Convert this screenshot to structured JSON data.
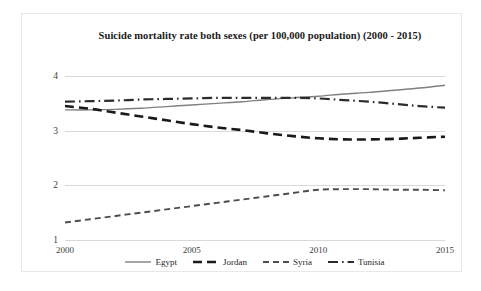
{
  "chart_data": {
    "type": "line",
    "title": "Suicide mortality rate both sexes (per 100,000 population) (2000 - 2015)",
    "xlabel": "",
    "ylabel": "",
    "xlim": [
      2000,
      2015
    ],
    "ylim": [
      1,
      4
    ],
    "grid": true,
    "legend_position": "bottom",
    "xticks": [
      "2000",
      "2005",
      "2010",
      "2015"
    ],
    "xtick_values": [
      2000,
      2005,
      2010,
      2015
    ],
    "yticks": [
      "1",
      "2",
      "3",
      "4"
    ],
    "ytick_values": [
      1,
      2,
      3,
      4
    ],
    "x": [
      2000,
      2001,
      2002,
      2003,
      2004,
      2005,
      2006,
      2007,
      2008,
      2009,
      2010,
      2011,
      2012,
      2013,
      2014,
      2015
    ],
    "series": [
      {
        "name": "Egypt",
        "style": "solid",
        "color": "#7f7f7f",
        "values": [
          3.38,
          3.38,
          3.39,
          3.41,
          3.44,
          3.47,
          3.5,
          3.53,
          3.57,
          3.6,
          3.63,
          3.67,
          3.7,
          3.74,
          3.78,
          3.83
        ]
      },
      {
        "name": "Jordan",
        "style": "dashed-thick",
        "color": "#1a1a1a",
        "values": [
          3.45,
          3.4,
          3.33,
          3.26,
          3.19,
          3.12,
          3.06,
          3.01,
          2.95,
          2.9,
          2.86,
          2.84,
          2.84,
          2.85,
          2.87,
          2.89
        ]
      },
      {
        "name": "Syria",
        "style": "dashed",
        "color": "#4d4d4d",
        "values": [
          1.32,
          1.38,
          1.44,
          1.5,
          1.56,
          1.62,
          1.68,
          1.74,
          1.8,
          1.86,
          1.92,
          1.93,
          1.93,
          1.92,
          1.92,
          1.91
        ]
      },
      {
        "name": "Tunisia",
        "style": "dash-dot",
        "color": "#2b2b2b",
        "values": [
          3.53,
          3.54,
          3.55,
          3.57,
          3.58,
          3.59,
          3.6,
          3.6,
          3.6,
          3.6,
          3.59,
          3.56,
          3.53,
          3.49,
          3.45,
          3.42
        ]
      }
    ]
  },
  "legend": {
    "items": [
      {
        "label": "Egypt"
      },
      {
        "label": "Jordan"
      },
      {
        "label": "Syria"
      },
      {
        "label": "Tunisia"
      }
    ]
  }
}
